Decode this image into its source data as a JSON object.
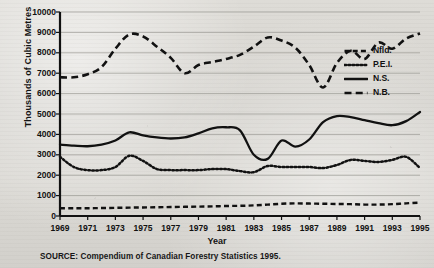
{
  "chart_data": {
    "type": "line",
    "title": "",
    "xlabel": "Year",
    "ylabel": "Thousands of Cubic Metres",
    "source": "SOURCE: Compendium of Canadian Forestry Statistics 1995.",
    "xlim": [
      1969,
      1995
    ],
    "ylim": [
      0,
      10000
    ],
    "grid": true,
    "legend_position": "right",
    "x": [
      1969,
      1970,
      1971,
      1972,
      1973,
      1974,
      1975,
      1976,
      1977,
      1978,
      1979,
      1980,
      1981,
      1982,
      1983,
      1984,
      1985,
      1986,
      1987,
      1988,
      1989,
      1990,
      1991,
      1992,
      1993,
      1994,
      1995
    ],
    "xticks": [
      "1969",
      "1971",
      "1973",
      "1975",
      "1977",
      "1979",
      "1981",
      "1983",
      "1985",
      "1987",
      "1989",
      "1991",
      "1993",
      "1995"
    ],
    "yticks": [
      "0",
      "1000",
      "2000",
      "3000",
      "4000",
      "5000",
      "6000",
      "7000",
      "8000",
      "9000",
      "10000"
    ],
    "series": [
      {
        "name": "Nfld.",
        "style": "dashed",
        "values": [
          380,
          380,
          380,
          390,
          400,
          410,
          420,
          430,
          440,
          450,
          460,
          470,
          490,
          500,
          520,
          560,
          600,
          620,
          610,
          600,
          590,
          580,
          560,
          560,
          580,
          620,
          660
        ]
      },
      {
        "name": "P.E.I.",
        "style": "dotted",
        "values": [
          2900,
          2400,
          2250,
          2250,
          2400,
          2950,
          2700,
          2300,
          2250,
          2250,
          2250,
          2300,
          2300,
          2200,
          2150,
          2450,
          2400,
          2400,
          2400,
          2350,
          2500,
          2750,
          2700,
          2650,
          2750,
          2900,
          2350
        ]
      },
      {
        "name": "N.S.",
        "style": "solid",
        "values": [
          3500,
          3450,
          3420,
          3500,
          3700,
          4100,
          3950,
          3850,
          3800,
          3850,
          4050,
          4300,
          4350,
          4200,
          3000,
          2800,
          3700,
          3400,
          3750,
          4600,
          4900,
          4850,
          4700,
          4550,
          4450,
          4650,
          5100
        ]
      },
      {
        "name": "N.B.",
        "style": "longdash",
        "values": [
          6800,
          6800,
          6950,
          7300,
          8200,
          8900,
          8800,
          8300,
          7750,
          7000,
          7400,
          7550,
          7700,
          7900,
          8300,
          8750,
          8600,
          8250,
          7400,
          6300,
          7500,
          8100,
          7700,
          8500,
          8200,
          8700,
          8950
        ]
      }
    ]
  },
  "legend": {
    "items": [
      {
        "label": "Nfld.",
        "style": "dashed"
      },
      {
        "label": "P.E.I.",
        "style": "dotted"
      },
      {
        "label": "N.S.",
        "style": "solid"
      },
      {
        "label": "N.B.",
        "style": "longdash"
      }
    ]
  },
  "colors": {
    "ink": "#111111",
    "grid": "#9a9892",
    "paper": "#d8d6d1"
  }
}
